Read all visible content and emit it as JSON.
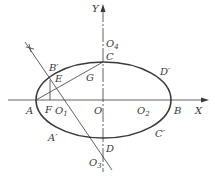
{
  "diagram": {
    "colors": {
      "stroke": "#3a3a3a",
      "background": "#ffffff"
    },
    "axes": {
      "x_label": "X",
      "y_label": "Y"
    },
    "labels": {
      "A": "A",
      "B": "B",
      "C": "C",
      "D": "D",
      "B_prime": "B",
      "A_prime": "A",
      "C_prime": "C",
      "D_prime": "D",
      "prime": "′",
      "E": "E",
      "F": "F",
      "G": "G",
      "O": "O",
      "O1": "O",
      "O1_sub": "1",
      "O2": "O",
      "O2_sub": "2",
      "O3": "O",
      "O3_sub": "3",
      "O4": "O",
      "O4_sub": "4"
    }
  }
}
